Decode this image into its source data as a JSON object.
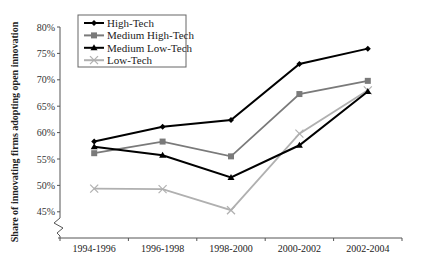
{
  "chart_data": {
    "type": "line",
    "title": "",
    "xlabel": "",
    "ylabel": "Share of innovating firms adopting open innovation",
    "categories": [
      "1994-1996",
      "1996-1998",
      "1998-2000",
      "2000-2002",
      "2002-2004"
    ],
    "ylim": [
      0.43,
      0.8
    ],
    "yticks": [
      "45%",
      "50%",
      "55%",
      "60%",
      "65%",
      "70%",
      "75%",
      "80%"
    ],
    "y_axis_break": true,
    "grid": false,
    "legend_position": "top-left",
    "series": [
      {
        "name": "High-Tech",
        "color": "#000000",
        "marker": "diamond",
        "values": [
          0.583,
          0.611,
          0.624,
          0.73,
          0.759
        ]
      },
      {
        "name": "Medium High-Tech",
        "color": "#7a7a7a",
        "marker": "square",
        "values": [
          0.561,
          0.583,
          0.555,
          0.673,
          0.698
        ]
      },
      {
        "name": "Medium Low-Tech",
        "color": "#000000",
        "marker": "triangle",
        "values": [
          0.573,
          0.557,
          0.515,
          0.576,
          0.678
        ]
      },
      {
        "name": "Low-Tech",
        "color": "#b0b0b0",
        "marker": "x",
        "values": [
          0.494,
          0.493,
          0.453,
          0.598,
          0.68
        ]
      }
    ]
  }
}
